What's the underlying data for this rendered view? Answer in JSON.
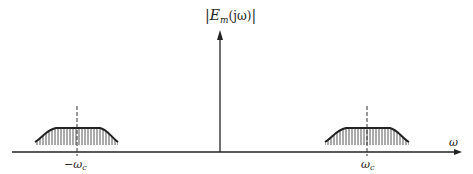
{
  "diagram": {
    "title_parts": {
      "bar_left": "|",
      "symbol": "E",
      "subscript": "m",
      "argument": "(jω)",
      "bar_right": "|"
    },
    "axis_label": "ω",
    "lobes": [
      {
        "center_label": "−ω",
        "center_subscript": "c"
      },
      {
        "center_label": "ω",
        "center_subscript": "c"
      }
    ],
    "impulse": {
      "position": "ω = 0"
    },
    "colors": {
      "ink": "#222222",
      "hatch": "#555555",
      "background": "#ffffff"
    }
  }
}
